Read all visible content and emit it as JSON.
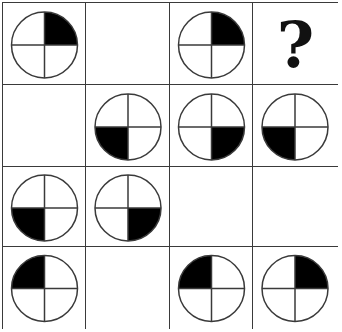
{
  "puzzle": {
    "rows": 4,
    "cols": 4,
    "col_edges": [
      2,
      85,
      169,
      252,
      336
    ],
    "row_edges": [
      2,
      84,
      166,
      246,
      327
    ],
    "fill_color": "#000000",
    "line_color": "#3a3a3a",
    "question_mark": "?",
    "cells": [
      [
        {
          "type": "circle",
          "filled": "TR"
        },
        {
          "type": "empty"
        },
        {
          "type": "circle",
          "filled": "TR"
        },
        {
          "type": "question",
          "label": "?"
        }
      ],
      [
        {
          "type": "empty"
        },
        {
          "type": "circle",
          "filled": "BL"
        },
        {
          "type": "circle",
          "filled": "BR"
        },
        {
          "type": "circle",
          "filled": "BL"
        }
      ],
      [
        {
          "type": "circle",
          "filled": "BL"
        },
        {
          "type": "circle",
          "filled": "BR"
        },
        {
          "type": "empty"
        },
        {
          "type": "empty"
        }
      ],
      [
        {
          "type": "circle",
          "filled": "TL"
        },
        {
          "type": "empty"
        },
        {
          "type": "circle",
          "filled": "TL"
        },
        {
          "type": "circle",
          "filled": "TR"
        }
      ]
    ]
  }
}
